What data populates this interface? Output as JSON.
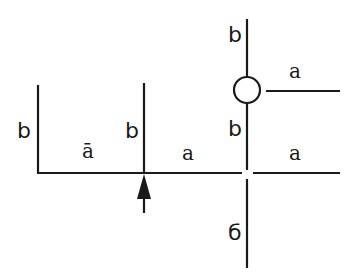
{
  "diagram": {
    "type": "line-junction diagram",
    "stroke_color": "#1a1a1a",
    "background": "#ffffff",
    "labels": {
      "left_b": "b",
      "left_a_macron": "ā",
      "middle_b": "b",
      "middle_a": "a",
      "top_right_b": "b",
      "circle_right_a": "a",
      "right_middle_b": "b",
      "right_bottom_a": "a",
      "bottom_6": "б"
    },
    "elements": {
      "circle_node": "open-circle-junction",
      "arrow": "upward-arrow",
      "crossing": "gap-crossing"
    }
  }
}
